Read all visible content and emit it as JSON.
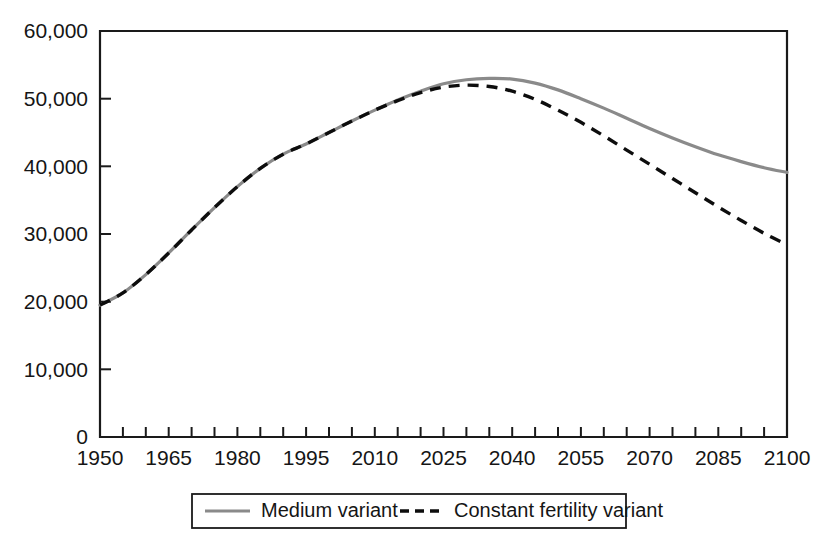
{
  "chart_data": {
    "type": "line",
    "title": "",
    "subtitle": "",
    "xlabel": "",
    "ylabel": "",
    "xlim": [
      1950,
      2100
    ],
    "ylim": [
      0,
      60000
    ],
    "grid": false,
    "legend_position": "bottom-center",
    "x_tick_labels": [
      "1950",
      "1965",
      "1980",
      "1995",
      "2010",
      "2025",
      "2040",
      "2055",
      "2070",
      "2085",
      "2100"
    ],
    "x_tick_values": [
      1950,
      1965,
      1980,
      1995,
      2010,
      2025,
      2040,
      2055,
      2070,
      2085,
      2100
    ],
    "x_minor_tick_step": 5,
    "y_tick_labels": [
      "0",
      "10,000",
      "20,000",
      "30,000",
      "40,000",
      "50,000",
      "60,000"
    ],
    "y_tick_values": [
      0,
      10000,
      20000,
      30000,
      40000,
      50000,
      60000
    ],
    "x": [
      1950,
      1955,
      1960,
      1965,
      1970,
      1975,
      1980,
      1985,
      1990,
      1995,
      2000,
      2005,
      2010,
      2015,
      2020,
      2025,
      2030,
      2035,
      2040,
      2045,
      2050,
      2055,
      2060,
      2065,
      2070,
      2075,
      2080,
      2085,
      2090,
      2095,
      2100
    ],
    "series": [
      {
        "name": "Medium variant",
        "style": "solid",
        "color": "#8a8a8a",
        "values": [
          19500,
          21300,
          24000,
          27200,
          30600,
          33900,
          37000,
          39700,
          41800,
          43300,
          45000,
          46700,
          48300,
          49800,
          51100,
          52200,
          52800,
          53000,
          52900,
          52300,
          51300,
          50000,
          48600,
          47100,
          45600,
          44200,
          42900,
          41700,
          40700,
          39800,
          39100
        ]
      },
      {
        "name": "Constant fertility variant",
        "style": "dashed",
        "color": "#0d0d0d",
        "values": [
          19500,
          21300,
          24000,
          27200,
          30600,
          33900,
          37000,
          39700,
          41800,
          43300,
          45000,
          46700,
          48300,
          49700,
          50900,
          51700,
          52000,
          51800,
          51100,
          49900,
          48300,
          46500,
          44500,
          42400,
          40300,
          38200,
          36100,
          34000,
          32000,
          30100,
          28400
        ]
      }
    ]
  },
  "legend": {
    "entries": [
      {
        "label": "Medium variant",
        "marker": "solid-line-gray"
      },
      {
        "label": "Constant fertility variant",
        "marker": "dashed-line-black"
      }
    ]
  },
  "colors": {
    "medium_variant": "#8a8a8a",
    "constant_fertility_variant": "#0d0d0d",
    "axis": "#1a1a1a",
    "background": "#ffffff"
  }
}
